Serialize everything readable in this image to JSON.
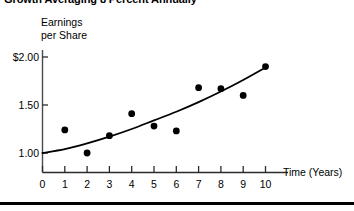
{
  "chart_data": {
    "type": "scatter",
    "title": "Growth Averaging 8 Percent Annually",
    "xlabel": "Time (Years)",
    "ylabel": "Earnings per Share",
    "ylabel_line1": "Earnings",
    "ylabel_line2": "per Share",
    "xlim": [
      0,
      10
    ],
    "ylim": [
      0.8,
      2.1
    ],
    "grid": false,
    "legend": null,
    "xticks": [
      0,
      1,
      2,
      3,
      4,
      5,
      6,
      7,
      8,
      9,
      10
    ],
    "xtick_labels": [
      "0",
      "1",
      "2",
      "3",
      "4",
      "5",
      "6",
      "7",
      "8",
      "9",
      "10"
    ],
    "yticks": [
      1.0,
      1.5,
      2.0
    ],
    "ytick_labels": [
      "1.00",
      "1.50",
      "$2.00"
    ],
    "series": [
      {
        "name": "Earnings per Share",
        "type": "scatter",
        "marker": "filled-circle",
        "color": "#000000",
        "x": [
          1,
          2,
          3,
          4,
          5,
          6,
          7,
          8,
          9,
          10
        ],
        "y": [
          1.24,
          1.0,
          1.18,
          1.41,
          1.28,
          1.23,
          1.68,
          1.67,
          1.6,
          1.9
        ]
      },
      {
        "name": "Trend (8% annual growth)",
        "type": "line",
        "color": "#000000",
        "x": [
          0,
          1,
          2,
          3,
          4,
          5,
          6,
          7,
          8,
          9,
          10
        ],
        "y": [
          1.0,
          1.04,
          1.1,
          1.17,
          1.25,
          1.34,
          1.43,
          1.53,
          1.64,
          1.76,
          1.89
        ]
      }
    ],
    "annotations": []
  },
  "axes": {
    "y_caption_line1": "Earnings",
    "y_caption_line2": "per Share",
    "x_caption": "Time (Years)"
  },
  "colors": {
    "ink": "#000000",
    "background": "#ffffff",
    "axis": "#3b3b3b"
  }
}
